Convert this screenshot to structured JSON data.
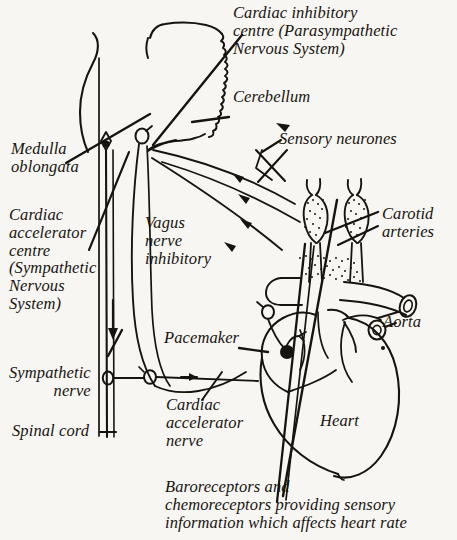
{
  "figure": {
    "background_color": "#f7f6f3",
    "ink_color": "#17140f",
    "width": 457,
    "height": 540
  },
  "labels": {
    "cardiac_inhibitory_centre": "Cardiac inhibitory\ncentre (Parasympathetic\nNervous System)",
    "cerebellum": "Cerebellum",
    "sensory_neurones": "Sensory neurones",
    "medulla_oblongata": "Medulla\noblongata",
    "cardiac_accelerator_centre": "Cardiac\naccelerator\ncentre\n(Sympathetic\nNervous\nSystem)",
    "vagus_nerve_inhibitory": "Vagus\nnerve\ninhibitory",
    "carotid_arteries": "Carotid\narteries",
    "aorta": "Aorta",
    "pacemaker": "Pacemaker",
    "sympathetic_nerve": "Sympathetic\nnerve",
    "cardiac_accelerator_nerve": "Cardiac\naccelerator\nnerve",
    "spinal_cord": "Spinal cord",
    "heart": "Heart",
    "baroreceptors_caption": "Baroreceptors and\nchemoreceptors providing sensory\ninformation which affects heart rate"
  },
  "structures": [
    {
      "name": "brain-outline",
      "label": "Brain (cerebrum and cerebellum)"
    },
    {
      "name": "cerebellum-shape",
      "label": "Cerebellum"
    },
    {
      "name": "medulla-oblongata-shape",
      "label": "Medulla oblongata"
    },
    {
      "name": "spinal-cord-shape",
      "label": "Spinal cord"
    },
    {
      "name": "vagus-nerve-path",
      "label": "Vagus nerve (inhibitory)"
    },
    {
      "name": "sympathetic-nerve-path",
      "label": "Sympathetic nerve"
    },
    {
      "name": "cardiac-accelerator-nerve-path",
      "label": "Cardiac accelerator nerve"
    },
    {
      "name": "sensory-neurone-paths",
      "label": "Sensory neurones"
    },
    {
      "name": "carotid-artery-left",
      "label": "Left carotid artery with receptor"
    },
    {
      "name": "carotid-artery-right",
      "label": "Right carotid artery with receptor"
    },
    {
      "name": "aortic-arch-receptor",
      "label": "Aortic arch receptor"
    },
    {
      "name": "heart-outline",
      "label": "Heart"
    },
    {
      "name": "pacemaker-node",
      "label": "Pacemaker (sino-atrial node)"
    },
    {
      "name": "aorta-vessel",
      "label": "Aorta"
    }
  ]
}
